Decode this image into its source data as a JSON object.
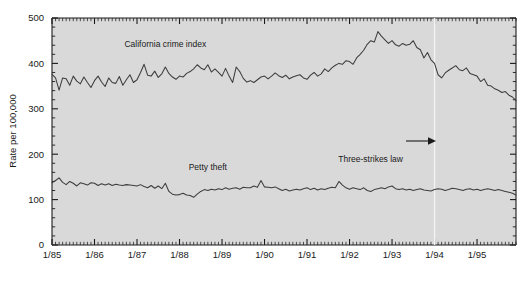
{
  "chart_data": {
    "type": "line",
    "title": "",
    "subtitle": "",
    "xlabel": "",
    "ylabel": "Rate per 100,000",
    "ylim": [
      0,
      500
    ],
    "ytick_labels": [
      "0",
      "100",
      "200",
      "300",
      "400",
      "500"
    ],
    "ytick_values": [
      0,
      100,
      200,
      300,
      400,
      500
    ],
    "xtick_labels": [
      "1/85",
      "1/86",
      "1/87",
      "1/88",
      "1/89",
      "1/90",
      "1/91",
      "1/92",
      "1/93",
      "1/94",
      "1/95"
    ],
    "xtick_values": [
      0,
      12,
      24,
      36,
      48,
      60,
      72,
      84,
      96,
      108,
      120
    ],
    "x_minor_interval_months": 1,
    "xlim_months": [
      0,
      131
    ],
    "grid": false,
    "legend_position": "inline-labels",
    "plot_background": "#d9d9d9",
    "line_color": "#3d3d3d",
    "annotations": [
      {
        "name": "three-strikes-law",
        "text": "Three-strikes law",
        "arrow": "→",
        "x_months": 108,
        "y_value": 190,
        "marker": "vertical-dashed-line"
      }
    ],
    "series": [
      {
        "name": "California crime index",
        "label": "California crime index",
        "label_x_months": 32,
        "label_y_value": 437,
        "values": [
          376,
          368,
          341,
          368,
          366,
          352,
          372,
          361,
          355,
          370,
          358,
          347,
          362,
          372,
          359,
          349,
          368,
          358,
          356,
          371,
          352,
          364,
          375,
          358,
          364,
          380,
          398,
          374,
          372,
          383,
          369,
          377,
          392,
          378,
          370,
          365,
          372,
          370,
          378,
          382,
          388,
          397,
          390,
          386,
          397,
          381,
          388,
          380,
          372,
          389,
          372,
          358,
          392,
          382,
          367,
          359,
          362,
          358,
          364,
          370,
          372,
          366,
          372,
          379,
          373,
          369,
          374,
          366,
          370,
          373,
          375,
          368,
          365,
          374,
          380,
          372,
          377,
          388,
          382,
          390,
          396,
          400,
          398,
          406,
          404,
          398,
          412,
          420,
          429,
          442,
          450,
          447,
          470,
          460,
          452,
          444,
          450,
          441,
          438,
          444,
          440,
          442,
          450,
          435,
          430,
          412,
          424,
          408,
          400,
          375,
          368,
          379,
          385,
          390,
          395,
          386,
          384,
          390,
          378,
          375,
          372,
          360,
          366,
          352,
          350,
          344,
          341,
          336,
          338,
          330,
          326,
          318
        ]
      },
      {
        "name": "Petty theft",
        "label": "Petty theft",
        "label_x_months": 44,
        "label_y_value": 165,
        "values": [
          137,
          142,
          148,
          138,
          133,
          140,
          136,
          130,
          137,
          135,
          132,
          137,
          136,
          131,
          135,
          132,
          135,
          131,
          134,
          132,
          131,
          133,
          132,
          131,
          130,
          133,
          129,
          126,
          131,
          125,
          130,
          124,
          136,
          118,
          112,
          110,
          111,
          114,
          110,
          109,
          105,
          112,
          118,
          122,
          120,
          123,
          121,
          124,
          122,
          126,
          123,
          125,
          126,
          123,
          127,
          126,
          126,
          130,
          127,
          142,
          128,
          127,
          126,
          128,
          124,
          120,
          123,
          119,
          121,
          123,
          121,
          124,
          126,
          122,
          125,
          121,
          124,
          122,
          125,
          127,
          126,
          140,
          132,
          126,
          123,
          126,
          124,
          122,
          126,
          120,
          118,
          122,
          124,
          126,
          124,
          128,
          130,
          124,
          122,
          124,
          121,
          123,
          120,
          122,
          124,
          121,
          120,
          119,
          122,
          124,
          123,
          120,
          122,
          125,
          124,
          122,
          120,
          123,
          124,
          121,
          123,
          120,
          122,
          124,
          122,
          120,
          122,
          120,
          118,
          116,
          114,
          110
        ]
      }
    ]
  },
  "axis": {
    "ylabel": "Rate per 100,000"
  }
}
